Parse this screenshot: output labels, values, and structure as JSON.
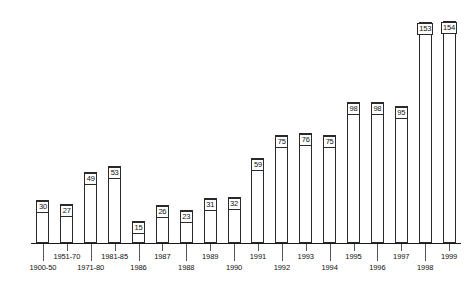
{
  "chart_data": {
    "type": "bar",
    "title": "",
    "subtitle": "",
    "xlabel": "",
    "ylabel": "",
    "grid": false,
    "legend": "none",
    "axis": {
      "y_visible": false,
      "x_visible": true,
      "ylim": [
        0,
        160
      ]
    },
    "categories": [
      "1900-50",
      "1951-70",
      "1971-80",
      "1981-85",
      "1986",
      "1987",
      "1988",
      "1989",
      "1990",
      "1991",
      "1992",
      "1993",
      "1994",
      "1995",
      "1996",
      "1997",
      "1998",
      "1999"
    ],
    "values": [
      30,
      27,
      49,
      53,
      15,
      26,
      23,
      31,
      32,
      59,
      75,
      76,
      75,
      98,
      98,
      95,
      153,
      154
    ],
    "label_rows": [
      1,
      0,
      1,
      0,
      1,
      0,
      1,
      0,
      1,
      0,
      1,
      0,
      1,
      0,
      1,
      0,
      1,
      0
    ],
    "colors": {
      "bar_stroke": "#2a2a2a",
      "bar_fill": "transparent",
      "axis": "#1a1a1a",
      "text": "#111111",
      "background": "#ffffff"
    }
  }
}
